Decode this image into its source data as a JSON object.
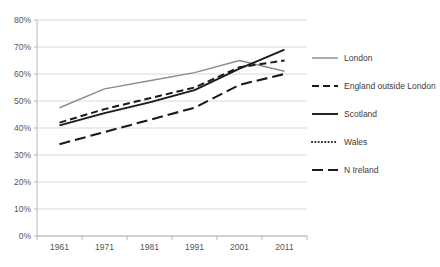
{
  "chart_data": {
    "type": "line",
    "title": "",
    "subtitle": "",
    "xlabel": "",
    "ylabel": "",
    "x": [
      1961,
      1971,
      1981,
      1991,
      2001,
      2011
    ],
    "categories": [
      "1961",
      "1971",
      "1981",
      "1991",
      "2001",
      "2011"
    ],
    "xtick_labels": [
      "1961",
      "1971",
      "1981",
      "1991",
      "2001",
      "2011"
    ],
    "ytick_labels": [
      "0%",
      "10%",
      "20%",
      "30%",
      "40%",
      "50%",
      "60%",
      "70%",
      "80%"
    ],
    "ytick_values": [
      0,
      10,
      20,
      30,
      40,
      50,
      60,
      70,
      80
    ],
    "ylim": [
      0,
      80
    ],
    "xlim": [
      1961,
      2011
    ],
    "grid": "horizontal",
    "legend_position": "right",
    "series": [
      {
        "name": "London",
        "values": [
          47.5,
          54.5,
          57.5,
          60.5,
          65.0,
          61.0
        ],
        "style": "solid",
        "color": "#8c8c8c",
        "width": 1.4
      },
      {
        "name": "England outside London",
        "values": [
          42.0,
          47.0,
          51.0,
          55.0,
          62.5,
          65.0
        ],
        "style": "dashed",
        "color": "#1a1a1a",
        "width": 2.0
      },
      {
        "name": "Scotland",
        "values": [
          41.0,
          45.5,
          49.5,
          54.0,
          62.0,
          69.0
        ],
        "style": "solid",
        "color": "#1a1a1a",
        "width": 1.9
      },
      {
        "name": "Wales",
        "values": [
          40.5,
          45.0,
          49.0,
          54.5,
          60.5,
          64.5
        ],
        "style": "dotted",
        "color": "#1a1a1a",
        "width": 2.0
      },
      {
        "name": "N Ireland",
        "values": [
          34.0,
          38.5,
          43.0,
          47.5,
          56.0,
          60.0
        ],
        "style": "longdash",
        "color": "#1a1a1a",
        "width": 2.1
      }
    ]
  },
  "legend": {
    "entries": [
      {
        "label": "London"
      },
      {
        "label": "England outside London"
      },
      {
        "label": "Scotland"
      },
      {
        "label": "Wales"
      },
      {
        "label": "N Ireland"
      }
    ]
  },
  "colors": {
    "background": "#ffffff",
    "grid": "#c8c8c8",
    "axis": "#a8a8a8",
    "text": "#555555",
    "london": "#8c8c8c",
    "black_series": "#1a1a1a"
  }
}
